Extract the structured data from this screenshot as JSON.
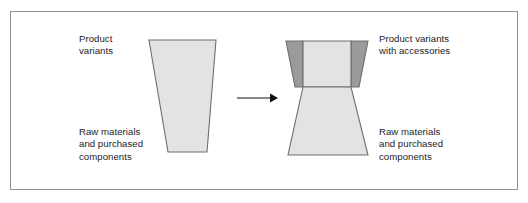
{
  "figure": {
    "title_visible": false,
    "background_color": "#ffffff",
    "frame": {
      "name": "figure-border",
      "border_color": "#8f8f8f",
      "fill": "#ffffff"
    },
    "colors": {
      "light_gray_fill": "#e3e3e3",
      "dark_gray_fill": "#9a9a9a",
      "outline": "#6e6e6e",
      "text": "#1c1c1c",
      "arrow": "#111111"
    },
    "labels": {
      "left_top": "Product\nvariants",
      "left_bottom": "Raw materials\nand purchased\ncomponents",
      "right_top": "Product variants\nwith accessories",
      "right_bottom": "Raw materials\nand purchased\ncomponents"
    },
    "shapes": {
      "left_funnel": {
        "name": "inverted-trapezoid-left",
        "description": "single inverted trapezoid, wide at top, narrow at bottom",
        "fill": "#e3e3e3",
        "points": "149,40 216,40 207,152 168,152"
      },
      "right_top_wing_left": {
        "name": "accessory-wing-left",
        "fill": "#9a9a9a",
        "points": "286,41 303,41 303,87 295,87"
      },
      "right_top_wing_right": {
        "name": "accessory-wing-right",
        "fill": "#9a9a9a",
        "points": "351,41 368,41 359,87 351,87"
      },
      "right_top_core": {
        "name": "product-core-top",
        "fill": "#e3e3e3",
        "points": "303,41 351,41 351,87 303,87"
      },
      "right_bottom": {
        "name": "raw-materials-trapezoid-right",
        "description": "trapezoid narrow at top, wide at bottom",
        "fill": "#e3e3e3",
        "points": "303,87 351,87 368,155 288,155"
      }
    },
    "arrow": {
      "name": "transformation-arrow",
      "direction": "right",
      "x1": 237,
      "x2": 276,
      "y": 98
    }
  }
}
